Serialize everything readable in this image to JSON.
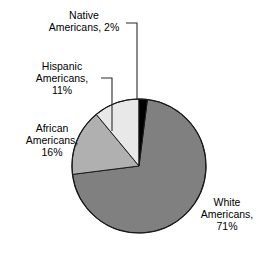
{
  "chart_data": {
    "type": "pie",
    "title": "",
    "subtitle": "",
    "xlabel": "",
    "ylabel": "",
    "legend_position": "none",
    "grid": false,
    "unit": "%",
    "categories": [
      "Native Americans",
      "White Americans",
      "African Americans",
      "Hispanic Americans"
    ],
    "values": [
      2,
      71,
      16,
      11
    ],
    "slice_colors": [
      "#000000",
      "#808080",
      "#b0b0b0",
      "#e8e8e8"
    ],
    "start_angle_deg": 0,
    "direction": "clockwise",
    "slices": [
      {
        "label": "Native Americans",
        "value": 2,
        "value_text": "2%",
        "color": "#000000",
        "start_deg": 0,
        "end_deg": 7.2,
        "leader_line": true
      },
      {
        "label": "White Americans",
        "value": 71,
        "value_text": "71%",
        "color": "#808080",
        "start_deg": 7.2,
        "end_deg": 262.8,
        "leader_line": false
      },
      {
        "label": "African Americans",
        "value": 16,
        "value_text": "16%",
        "color": "#b0b0b0",
        "start_deg": 262.8,
        "end_deg": 320.4,
        "leader_line": false
      },
      {
        "label": "Hispanic Americans",
        "value": 11,
        "value_text": "11%",
        "color": "#e8e8e8",
        "start_deg": 320.4,
        "end_deg": 360,
        "leader_line": true
      }
    ]
  },
  "labels": {
    "native": {
      "line1": "Native",
      "line2": "Americans, 2%"
    },
    "hispanic": {
      "line1": "Hispanic",
      "line2": "Americans,",
      "line3": "11%"
    },
    "african": {
      "line1": "African",
      "line2": "Americans,",
      "line3": "16%"
    },
    "white": {
      "line1": "White",
      "line2": "Americans,",
      "line3": "71%"
    }
  },
  "style": {
    "background": "#ffffff",
    "outline_color": "#1a1a1a",
    "leader_color": "#2b2b2b",
    "text_color": "#000000"
  }
}
